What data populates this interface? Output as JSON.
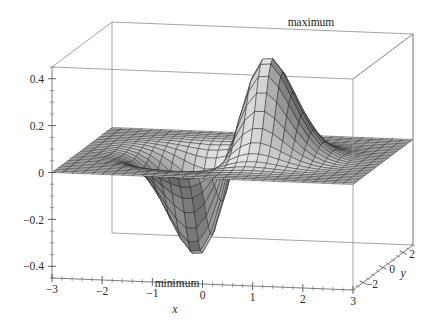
{
  "figure": {
    "kind": "3d-surface-plot",
    "background": "#ffffff",
    "frame_color": "#9a9a9a",
    "mesh_line_color": "#1c1c1c",
    "surface_fill_light": "#d8d8d8",
    "surface_fill_mid": "#9c9c9c",
    "surface_fill_dark": "#4a4a4a"
  },
  "axes": {
    "x": {
      "label": "x",
      "ticks": [
        "-3",
        "-2",
        "-1",
        "0",
        "1",
        "2",
        "3"
      ],
      "tick_values": [
        -3,
        -2,
        -1,
        0,
        1,
        2,
        3
      ],
      "range": [
        -3,
        3
      ]
    },
    "y": {
      "label": "y",
      "ticks": [
        "-2",
        "0",
        "2"
      ],
      "tick_values": [
        -2,
        0,
        2
      ],
      "range": [
        -3,
        3
      ]
    },
    "z": {
      "label": "",
      "ticks": [
        "0.4",
        "0.2",
        "0",
        "-0.2",
        "-0.4"
      ],
      "tick_values": [
        0.4,
        0.2,
        0,
        -0.2,
        -0.4
      ],
      "range": [
        -0.45,
        0.45
      ]
    }
  },
  "annotations": [
    {
      "name": "maximum-label",
      "text": "maximum",
      "at_x": 1.0,
      "at_y": 0.0,
      "at_z": 0.43
    },
    {
      "name": "minimum-label",
      "text": "minimum",
      "at_x": -1.0,
      "at_y": 0.0,
      "at_z": -0.44
    }
  ],
  "chart_data": {
    "type": "surface",
    "title": "",
    "xlabel": "x",
    "ylabel": "y",
    "zlabel": "",
    "function": "f(x,y) = x * exp(-x^2 - y^2)",
    "xlim": [
      -3,
      3
    ],
    "ylim": [
      -3,
      3
    ],
    "zlim": [
      -0.45,
      0.45
    ],
    "grid": false,
    "legend": "none",
    "mesh_divisions": {
      "x": 30,
      "y": 30
    },
    "extrema": [
      {
        "kind": "maximum",
        "label": "maximum",
        "x": 0.7071,
        "y": 0.0,
        "z": 0.4289
      },
      {
        "kind": "minimum",
        "label": "minimum",
        "x": -0.7071,
        "y": 0.0,
        "z": -0.4289
      }
    ],
    "z_tick_labels": [
      "0.4",
      "0.2",
      "0",
      "-0.2",
      "-0.4"
    ],
    "z_tick_values": [
      0.4,
      0.2,
      0,
      -0.2,
      -0.4
    ],
    "x_tick_labels": [
      "-3",
      "-2",
      "-1",
      "0",
      "1",
      "2",
      "3"
    ],
    "x_tick_values": [
      -3,
      -2,
      -1,
      0,
      1,
      2,
      3
    ],
    "y_tick_labels": [
      "-2",
      "0",
      "2"
    ],
    "y_tick_values": [
      -2,
      0,
      2
    ]
  }
}
